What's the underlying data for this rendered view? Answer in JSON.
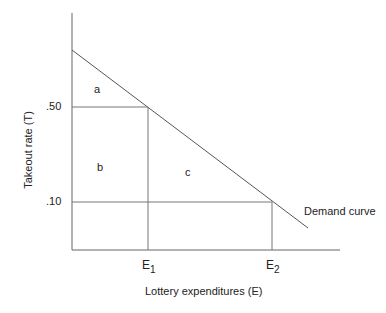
{
  "diagram": {
    "title": "",
    "y_axis_label": "Takeout rate (T)",
    "x_axis_label": "Lottery expenditures (E)",
    "y_ticks": [
      ".50",
      ".10"
    ],
    "x_ticks": [
      {
        "base": "E",
        "sub": "1"
      },
      {
        "base": "E",
        "sub": "2"
      }
    ],
    "regions": [
      "a",
      "b",
      "c"
    ],
    "curve_label": "Demand curve",
    "line_color": "#555555"
  }
}
